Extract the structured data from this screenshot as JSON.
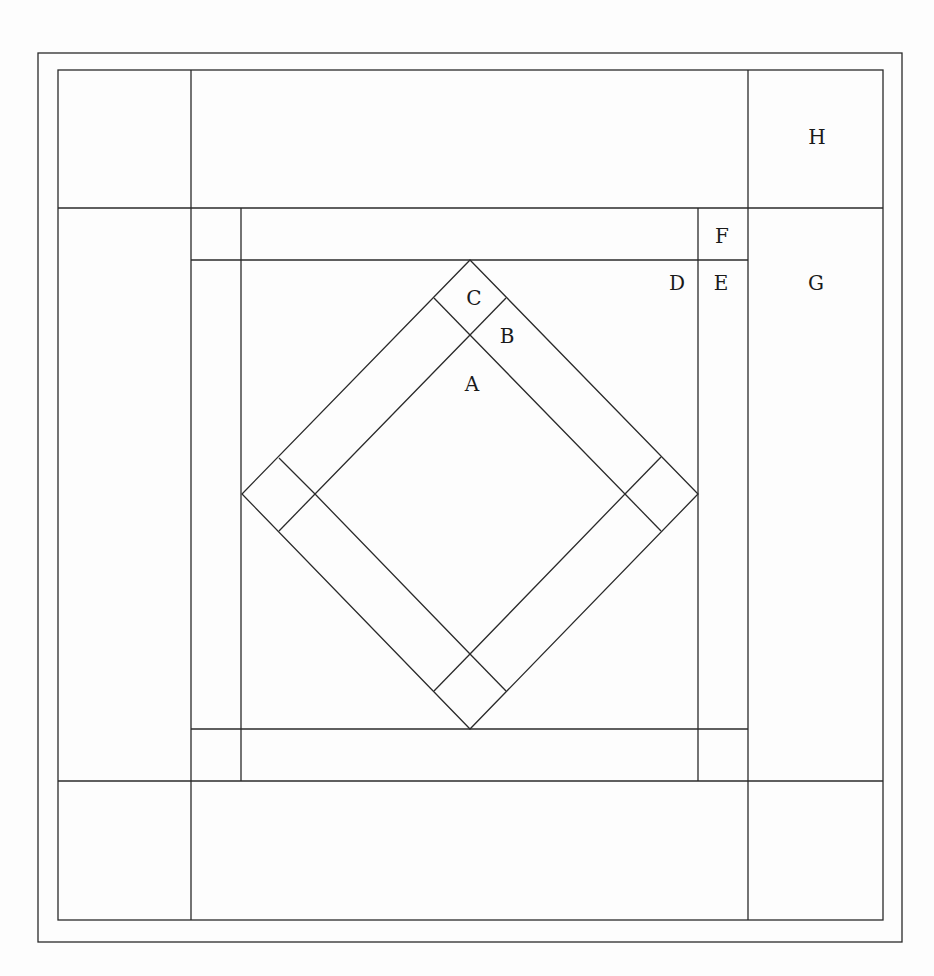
{
  "diagram": {
    "type": "quilt-block",
    "labels": {
      "A": "A",
      "B": "B",
      "C": "C",
      "D": "D",
      "E": "E",
      "F": "F",
      "G": "G",
      "H": "H"
    },
    "line_color": "#2a2a2a",
    "background": "#fdfdfd"
  }
}
